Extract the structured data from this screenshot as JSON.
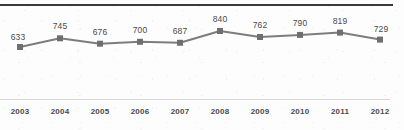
{
  "chart_data": {
    "type": "line",
    "title": "",
    "subtitle": "",
    "xlabel": "",
    "ylabel": "",
    "categories": [
      "2003",
      "2004",
      "2005",
      "2006",
      "2007",
      "2008",
      "2009",
      "2010",
      "2011",
      "2012"
    ],
    "values": [
      633,
      745,
      676,
      700,
      687,
      840,
      762,
      790,
      819,
      729
    ],
    "data_labels": [
      "633",
      "745",
      "676",
      "700",
      "687",
      "840",
      "762",
      "790",
      "819",
      "729"
    ],
    "series": [
      {
        "name": "",
        "values": [
          633,
          745,
          676,
          700,
          687,
          840,
          762,
          790,
          819,
          729
        ]
      }
    ],
    "ylim": [
      0,
      900
    ],
    "grid": false,
    "legend": false,
    "legend_position": "none",
    "marker": "square",
    "show_value_labels": true,
    "axis_tick_labels": [
      "2003",
      "2004",
      "2005",
      "2006",
      "2007",
      "2008",
      "2009",
      "2010",
      "2011",
      "2012"
    ]
  },
  "style": {
    "line_color": "#7d7d7d",
    "marker_color": "#6f6f6f",
    "label_color": "#4a4a4a",
    "tick_color": "#4a4a4a",
    "top_rule_color": "#3a3a3a",
    "axis_line_color": "#d6d6d6",
    "background_color": "#fdfdfd"
  }
}
